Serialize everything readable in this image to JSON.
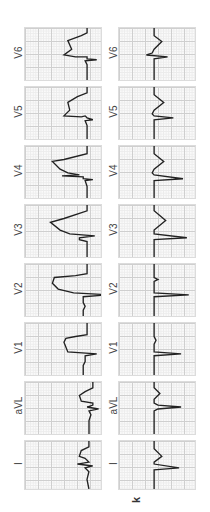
{
  "figure": {
    "panel_label": "k",
    "orientation": "rotated 90 degrees counter-clockwise",
    "leads": [
      "I",
      "aVL",
      "V1",
      "V2",
      "V3",
      "V4",
      "V5",
      "V6"
    ],
    "rows": [
      {
        "name": "top-row",
        "description": "ECG with ST elevation / abnormal repolarization",
        "leads": [
          "I",
          "aVL",
          "V1",
          "V2",
          "V3",
          "V4",
          "V5",
          "V6"
        ]
      },
      {
        "name": "bottom-row",
        "description": "ECG with normal repolarization",
        "leads": [
          "I",
          "aVL",
          "V1",
          "V2",
          "V3",
          "V4",
          "V5",
          "V6"
        ]
      }
    ]
  },
  "labels": {
    "left": {
      "v6": "V6",
      "v5": "V5",
      "v4": "V4",
      "v3": "V3",
      "v2": "V2",
      "v1": "V1",
      "avl": "aVL",
      "i": "I"
    },
    "right": {
      "v6": "V6",
      "v5": "V5",
      "v4": "V4",
      "v3": "V3",
      "v2": "V2",
      "v1": "V1",
      "avl": "aVL",
      "i": "I"
    }
  },
  "colors": {
    "grid_major": "#cfcfcf",
    "grid_minor": "#ececec",
    "trace": "#222222",
    "background": "#ffffff"
  }
}
